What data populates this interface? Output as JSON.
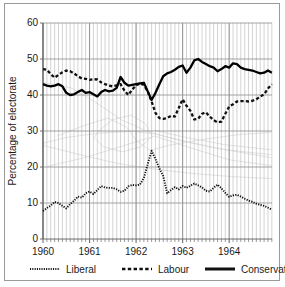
{
  "chart_data": {
    "type": "line",
    "title": "",
    "xlabel": "",
    "ylabel": "Percentage of electorate",
    "ylim": [
      0,
      60
    ],
    "yticks": [
      0,
      10,
      20,
      30,
      40,
      50,
      60
    ],
    "xlim": [
      1960.0,
      1964.92
    ],
    "xticks": [
      1960,
      1961,
      1962,
      1963,
      1964
    ],
    "xtick_labels": [
      "1960",
      "1961",
      "1962",
      "1963",
      "1964"
    ],
    "minor_xtick_interval_months": 1,
    "grid": "both",
    "legend_position": "below-axes",
    "series": [
      {
        "name": "Liberal",
        "style": "dotted",
        "color": "#111111",
        "x": [
          1960.0,
          1960.083,
          1960.167,
          1960.25,
          1960.333,
          1960.417,
          1960.5,
          1960.583,
          1960.667,
          1960.75,
          1960.833,
          1960.917,
          1961.0,
          1961.083,
          1961.167,
          1961.25,
          1961.333,
          1961.417,
          1961.5,
          1961.583,
          1961.667,
          1961.75,
          1961.833,
          1961.917,
          1962.0,
          1962.083,
          1962.167,
          1962.25,
          1962.333,
          1962.417,
          1962.5,
          1962.583,
          1962.667,
          1962.75,
          1962.833,
          1962.917,
          1963.0,
          1963.083,
          1963.167,
          1963.25,
          1963.333,
          1963.417,
          1963.5,
          1963.583,
          1963.667,
          1963.75,
          1963.833,
          1963.917,
          1964.0,
          1964.083,
          1964.167,
          1964.25,
          1964.333,
          1964.417,
          1964.5,
          1964.583,
          1964.667,
          1964.75,
          1964.833,
          1964.917
        ],
        "values": [
          7.8,
          8.6,
          9.3,
          10.3,
          10.0,
          9.2,
          8.5,
          9.7,
          10.6,
          11.8,
          11.5,
          12.7,
          13.2,
          12.5,
          13.6,
          14.7,
          14.3,
          14.2,
          14.2,
          13.8,
          13.1,
          13.4,
          14.6,
          15.0,
          14.9,
          15.1,
          17.0,
          20.8,
          24.5,
          22.2,
          19.6,
          17.5,
          12.7,
          13.6,
          14.4,
          13.8,
          14.7,
          14.2,
          14.8,
          15.4,
          14.9,
          14.3,
          13.4,
          13.2,
          14.2,
          15.1,
          14.1,
          12.8,
          11.7,
          12.1,
          12.3,
          11.8,
          11.2,
          10.7,
          10.3,
          9.8,
          9.5,
          9.2,
          8.7,
          8.2
        ]
      },
      {
        "name": "Labour",
        "style": "dashed",
        "color": "#111111",
        "x": [
          1960.0,
          1960.083,
          1960.167,
          1960.25,
          1960.333,
          1960.417,
          1960.5,
          1960.583,
          1960.667,
          1960.75,
          1960.833,
          1960.917,
          1961.0,
          1961.083,
          1961.167,
          1961.25,
          1961.333,
          1961.417,
          1961.5,
          1961.583,
          1961.667,
          1961.75,
          1961.833,
          1961.917,
          1962.0,
          1962.083,
          1962.167,
          1962.25,
          1962.333,
          1962.417,
          1962.5,
          1962.583,
          1962.667,
          1962.75,
          1962.833,
          1962.917,
          1963.0,
          1963.083,
          1963.167,
          1963.25,
          1963.333,
          1963.417,
          1963.5,
          1963.583,
          1963.667,
          1963.75,
          1963.833,
          1963.917,
          1964.0,
          1964.083,
          1964.167,
          1964.25,
          1964.333,
          1964.417,
          1964.5,
          1964.583,
          1964.667,
          1964.75,
          1964.833,
          1964.917
        ],
        "values": [
          47.2,
          47.0,
          45.8,
          44.8,
          45.6,
          46.3,
          46.8,
          46.6,
          46.0,
          45.2,
          44.6,
          44.5,
          44.2,
          44.4,
          44.3,
          43.5,
          43.0,
          42.6,
          42.4,
          42.7,
          43.0,
          41.2,
          40.0,
          41.5,
          42.7,
          43.2,
          42.8,
          41.0,
          38.2,
          35.0,
          33.6,
          33.4,
          33.6,
          34.2,
          34.0,
          36.4,
          38.8,
          37.0,
          35.6,
          33.2,
          33.4,
          34.8,
          35.2,
          34.0,
          33.0,
          32.4,
          32.6,
          34.8,
          36.8,
          37.4,
          38.2,
          38.3,
          38.3,
          38.2,
          38.4,
          38.8,
          39.6,
          40.2,
          41.8,
          43.0
        ]
      },
      {
        "name": "Conservative",
        "style": "solid",
        "color": "#000000",
        "x": [
          1960.0,
          1960.083,
          1960.167,
          1960.25,
          1960.333,
          1960.417,
          1960.5,
          1960.583,
          1960.667,
          1960.75,
          1960.833,
          1960.917,
          1961.0,
          1961.083,
          1961.167,
          1961.25,
          1961.333,
          1961.417,
          1961.5,
          1961.583,
          1961.667,
          1961.75,
          1961.833,
          1961.917,
          1962.0,
          1962.083,
          1962.167,
          1962.25,
          1962.333,
          1962.417,
          1962.5,
          1962.583,
          1962.667,
          1962.75,
          1962.833,
          1962.917,
          1963.0,
          1963.083,
          1963.167,
          1963.25,
          1963.333,
          1963.417,
          1963.5,
          1963.583,
          1963.667,
          1963.75,
          1963.833,
          1963.917,
          1964.0,
          1964.083,
          1964.167,
          1964.25,
          1964.333,
          1964.417,
          1964.5,
          1964.583,
          1964.667,
          1964.75,
          1964.833,
          1964.917
        ],
        "values": [
          43.0,
          42.6,
          42.4,
          42.6,
          43.0,
          42.4,
          40.6,
          40.0,
          40.2,
          40.8,
          41.4,
          40.6,
          40.8,
          40.2,
          39.6,
          40.8,
          41.4,
          41.0,
          41.2,
          42.0,
          45.0,
          43.4,
          42.6,
          42.8,
          43.0,
          43.2,
          43.4,
          41.0,
          38.6,
          40.6,
          43.0,
          45.2,
          46.0,
          46.4,
          47.0,
          47.8,
          48.2,
          46.2,
          47.6,
          49.6,
          50.0,
          49.2,
          48.6,
          48.0,
          47.6,
          46.6,
          47.2,
          48.0,
          47.6,
          48.8,
          48.6,
          47.6,
          47.2,
          47.0,
          46.8,
          46.4,
          46.0,
          46.2,
          46.8,
          46.2
        ]
      }
    ]
  },
  "legend": {
    "items": [
      {
        "label": "Liberal",
        "style": "dotted"
      },
      {
        "label": "Labour",
        "style": "dashed"
      },
      {
        "label": "Conservative",
        "style": "solid"
      }
    ]
  },
  "axes": {
    "y_title": "Percentage of electorate",
    "y_tick_labels": [
      "0",
      "10",
      "20",
      "30",
      "40",
      "50",
      "60"
    ],
    "x_tick_labels": [
      "1960",
      "1961",
      "1962",
      "1963",
      "1964"
    ]
  },
  "colors": {
    "ink": "#111111",
    "grid": "#8d8d8d",
    "minor_grid": "#b5b5b5",
    "frame": "#9a9a9a",
    "ghost": "#dddddd",
    "background": "#ffffff"
  }
}
